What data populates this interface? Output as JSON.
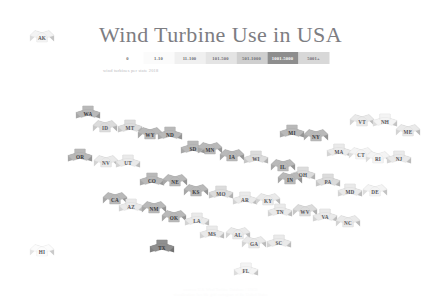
{
  "header": {
    "title": "Wind Turbine Use in USA",
    "subtitle": "wind turbines per state 2018",
    "credit": "sources: U.S. Wind Turbine Database / USGS\nvisualization: hex tile grid cartogram of the United States"
  },
  "legend": {
    "label": "number of wind turbines",
    "bins": [
      {
        "label": "0",
        "color": "#ffffff"
      },
      {
        "label": "1-10",
        "color": "#fbfbfb"
      },
      {
        "label": "11-100",
        "color": "#f0f0f0"
      },
      {
        "label": "101-500",
        "color": "#e4e4e4"
      },
      {
        "label": "501-1000",
        "color": "#cfcfcf"
      },
      {
        "label": "1001-5000",
        "color": "#8e8e8e"
      },
      {
        "label": "5001+",
        "color": "#d8d8d8"
      }
    ]
  },
  "colors": {
    "accent_dark": "#8e8e8e",
    "title": "#7d7d82",
    "label": "#56565b",
    "background": "#ffffff"
  },
  "chart_data": {
    "type": "heatmap",
    "title": "Wind Turbine Use in USA",
    "xlabel": "",
    "ylabel": "",
    "legend_position": "top-center",
    "grid": false,
    "bins": [
      "0",
      "1-10",
      "11-100",
      "101-500",
      "501-1000",
      "1001-5000",
      "5001+"
    ],
    "states": [
      {
        "code": "AK",
        "col": 0.5,
        "row": -0.5,
        "bin": 2,
        "x": 42,
        "y": 36
      },
      {
        "code": "HI",
        "col": 0.5,
        "row": 8.5,
        "bin": 1,
        "x": 42,
        "y": 250
      },
      {
        "code": "WA",
        "col": 1,
        "row": 0,
        "bin": 5,
        "x": 88,
        "y": 112
      },
      {
        "code": "ID",
        "col": 2,
        "row": 0.5,
        "bin": 4,
        "x": 105,
        "y": 126
      },
      {
        "code": "MT",
        "col": 3,
        "row": 0.5,
        "bin": 4,
        "x": 130,
        "y": 126
      },
      {
        "code": "WY",
        "col": 4,
        "row": 1,
        "bin": 5,
        "x": 150,
        "y": 133
      },
      {
        "code": "ND",
        "col": 5,
        "row": 1,
        "bin": 5,
        "x": 170,
        "y": 133
      },
      {
        "code": "MN",
        "col": 7,
        "row": 1.5,
        "bin": 5,
        "x": 210,
        "y": 148
      },
      {
        "code": "MI",
        "col": 9,
        "row": 1,
        "bin": 5,
        "x": 292,
        "y": 131
      },
      {
        "code": "NY",
        "col": 10,
        "row": 1,
        "bin": 5,
        "x": 316,
        "y": 135
      },
      {
        "code": "VT",
        "col": 11,
        "row": 0.5,
        "bin": 3,
        "x": 362,
        "y": 120
      },
      {
        "code": "NH",
        "col": 12,
        "row": 0.5,
        "bin": 2,
        "x": 385,
        "y": 120
      },
      {
        "code": "ME",
        "col": 13,
        "row": 1,
        "bin": 3,
        "x": 408,
        "y": 130
      },
      {
        "code": "OR",
        "col": 1,
        "row": 1.5,
        "bin": 5,
        "x": 80,
        "y": 155
      },
      {
        "code": "NV",
        "col": 2,
        "row": 2,
        "bin": 3,
        "x": 106,
        "y": 161
      },
      {
        "code": "UT",
        "col": 3,
        "row": 2,
        "bin": 3,
        "x": 128,
        "y": 161
      },
      {
        "code": "SD",
        "col": 5,
        "row": 2,
        "bin": 5,
        "x": 193,
        "y": 147
      },
      {
        "code": "IA",
        "col": 6,
        "row": 2,
        "bin": 5,
        "x": 232,
        "y": 155
      },
      {
        "code": "WI",
        "col": 7,
        "row": 2,
        "bin": 4,
        "x": 256,
        "y": 157
      },
      {
        "code": "MA",
        "col": 11,
        "row": 1.5,
        "bin": 3,
        "x": 339,
        "y": 150
      },
      {
        "code": "CT",
        "col": 12,
        "row": 2,
        "bin": 2,
        "x": 361,
        "y": 153
      },
      {
        "code": "RI",
        "col": 12.5,
        "row": 2.2,
        "bin": 2,
        "x": 378,
        "y": 157
      },
      {
        "code": "NJ",
        "col": 13,
        "row": 2,
        "bin": 3,
        "x": 399,
        "y": 157
      },
      {
        "code": "CA",
        "col": 1,
        "row": 3,
        "bin": 5,
        "x": 115,
        "y": 198
      },
      {
        "code": "CO",
        "col": 3,
        "row": 2.8,
        "bin": 5,
        "x": 152,
        "y": 179
      },
      {
        "code": "NE",
        "col": 4,
        "row": 2.8,
        "bin": 5,
        "x": 175,
        "y": 180
      },
      {
        "code": "IL",
        "col": 7,
        "row": 3,
        "bin": 5,
        "x": 283,
        "y": 165
      },
      {
        "code": "OH",
        "col": 8,
        "row": 3,
        "bin": 4,
        "x": 303,
        "y": 173
      },
      {
        "code": "PA",
        "col": 9,
        "row": 3,
        "bin": 4,
        "x": 328,
        "y": 180
      },
      {
        "code": "MD",
        "col": 10,
        "row": 3,
        "bin": 3,
        "x": 350,
        "y": 190
      },
      {
        "code": "DE",
        "col": 11,
        "row": 3,
        "bin": 2,
        "x": 375,
        "y": 190
      },
      {
        "code": "AZ",
        "col": 2,
        "row": 3.8,
        "bin": 3,
        "x": 131,
        "y": 205
      },
      {
        "code": "NM",
        "col": 3,
        "row": 3.8,
        "bin": 5,
        "x": 154,
        "y": 207
      },
      {
        "code": "KS",
        "col": 4,
        "row": 3.6,
        "bin": 5,
        "x": 196,
        "y": 190
      },
      {
        "code": "MO",
        "col": 5,
        "row": 3.6,
        "bin": 4,
        "x": 221,
        "y": 192
      },
      {
        "code": "AR",
        "col": 6,
        "row": 4,
        "bin": 3,
        "x": 245,
        "y": 198
      },
      {
        "code": "KY",
        "col": 7,
        "row": 4,
        "bin": 3,
        "x": 268,
        "y": 199
      },
      {
        "code": "IN",
        "col": 8,
        "row": 3.4,
        "bin": 5,
        "x": 290,
        "y": 178
      },
      {
        "code": "WV",
        "col": 9,
        "row": 4,
        "bin": 4,
        "x": 305,
        "y": 210
      },
      {
        "code": "VA",
        "col": 10,
        "row": 4,
        "bin": 3,
        "x": 325,
        "y": 215
      },
      {
        "code": "NC",
        "col": 11,
        "row": 4.2,
        "bin": 3,
        "x": 348,
        "y": 221
      },
      {
        "code": "OK",
        "col": 4,
        "row": 4.4,
        "bin": 5,
        "x": 174,
        "y": 216
      },
      {
        "code": "LA",
        "col": 5,
        "row": 4.6,
        "bin": 3,
        "x": 197,
        "y": 219
      },
      {
        "code": "TN",
        "col": 7,
        "row": 4.6,
        "bin": 3,
        "x": 280,
        "y": 210
      },
      {
        "code": "MS",
        "col": 6,
        "row": 5,
        "bin": 3,
        "x": 212,
        "y": 232
      },
      {
        "code": "AL",
        "col": 7,
        "row": 5,
        "bin": 3,
        "x": 238,
        "y": 233
      },
      {
        "code": "GA",
        "col": 8,
        "row": 5.2,
        "bin": 3,
        "x": 254,
        "y": 242
      },
      {
        "code": "SC",
        "col": 9,
        "row": 5.2,
        "bin": 3,
        "x": 279,
        "y": 241
      },
      {
        "code": "TX",
        "col": 4,
        "row": 5.4,
        "bin": 6,
        "x": 162,
        "y": 246
      },
      {
        "code": "FL",
        "col": 8,
        "row": 6,
        "bin": 2,
        "x": 246,
        "y": 269
      }
    ]
  }
}
